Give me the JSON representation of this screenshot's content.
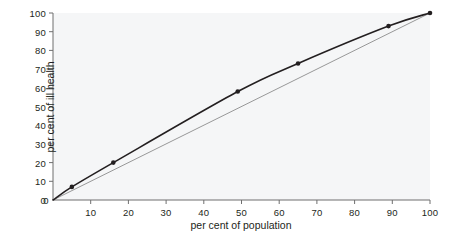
{
  "chart_data": {
    "type": "line",
    "title": "",
    "subtitle": "",
    "xlabel": "per cent of population",
    "ylabel": "per cent of ill health",
    "xlim": [
      0,
      100
    ],
    "ylim": [
      0,
      100
    ],
    "xticks": [
      0,
      10,
      20,
      30,
      40,
      50,
      60,
      70,
      80,
      90,
      100
    ],
    "yticks": [
      0,
      10,
      20,
      30,
      40,
      50,
      60,
      70,
      80,
      90,
      100
    ],
    "grid": false,
    "legend": "none",
    "series": [
      {
        "name": "concentration curve",
        "type": "line",
        "markers": true,
        "color": "#231f20",
        "line_width": 1.6,
        "x": [
          0,
          5,
          16,
          49,
          65,
          89,
          100
        ],
        "y": [
          0,
          7,
          20,
          58,
          73,
          93,
          100
        ]
      },
      {
        "name": "line of equality",
        "type": "line",
        "markers": false,
        "color": "#6f6f6f",
        "line_width": 0.7,
        "x": [
          0,
          100
        ],
        "y": [
          0,
          100
        ]
      }
    ],
    "annotations": []
  },
  "colors": {
    "plot_background": "#f5f6f7",
    "axis": "#6f6f6f",
    "text": "#231f20",
    "curve": "#231f20",
    "equality_line": "#6f6f6f"
  },
  "axis_labels": {
    "x": [
      "0",
      "10",
      "20",
      "30",
      "40",
      "50",
      "60",
      "70",
      "80",
      "90",
      "100"
    ],
    "y": [
      "0",
      "10",
      "20",
      "30",
      "40",
      "50",
      "60",
      "70",
      "80",
      "90",
      "100"
    ]
  }
}
